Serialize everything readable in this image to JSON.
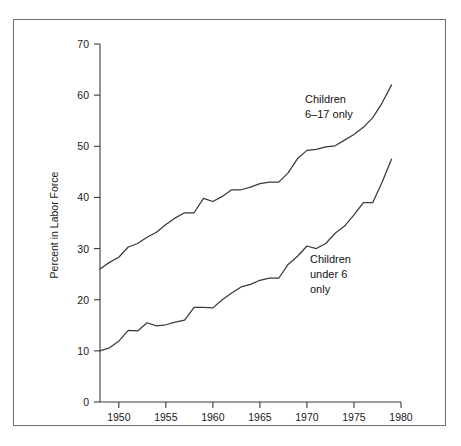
{
  "chart_data": {
    "type": "line",
    "title": "",
    "xlabel": "",
    "ylabel": "Percent in Labor Force",
    "xlim": [
      1948,
      1980
    ],
    "ylim": [
      0,
      70
    ],
    "xticks": [
      1950,
      1955,
      1960,
      1965,
      1970,
      1975,
      1980
    ],
    "yticks": [
      0,
      10,
      20,
      30,
      40,
      50,
      60,
      70
    ],
    "grid": false,
    "legend_position": "inline-annotation",
    "x": [
      1948,
      1949,
      1950,
      1951,
      1952,
      1953,
      1954,
      1955,
      1956,
      1957,
      1958,
      1959,
      1960,
      1961,
      1962,
      1963,
      1964,
      1965,
      1966,
      1967,
      1968,
      1969,
      1970,
      1971,
      1972,
      1973,
      1974,
      1975,
      1976,
      1977,
      1978,
      1979
    ],
    "series": [
      {
        "name": "Children 6-17 only",
        "annotation": "Children\n6–17 only",
        "values": [
          26.0,
          27.3,
          28.3,
          30.3,
          31.0,
          32.2,
          33.2,
          34.7,
          36.0,
          37.0,
          37.0,
          39.8,
          39.2,
          40.2,
          41.5,
          41.5,
          42.0,
          42.7,
          43.0,
          43.0,
          44.8,
          47.6,
          49.2,
          49.4,
          49.9,
          50.1,
          51.2,
          52.3,
          53.7,
          55.6,
          58.5,
          62.0
        ]
      },
      {
        "name": "Children under 6 only",
        "annotation": "Children\nunder 6\nonly",
        "values": [
          10.0,
          10.6,
          11.9,
          14.0,
          13.9,
          15.5,
          14.9,
          15.1,
          15.6,
          16.0,
          18.5,
          18.5,
          18.4,
          20.0,
          21.3,
          22.5,
          23.0,
          23.8,
          24.2,
          24.2,
          26.9,
          28.5,
          30.5,
          30.0,
          31.0,
          33.0,
          34.4,
          36.6,
          39.0,
          39.0,
          43.0,
          47.5
        ]
      }
    ],
    "annotations": [
      {
        "id": "upper-series-label",
        "lines": [
          "Children",
          "6–17 only"
        ]
      },
      {
        "id": "lower-series-label",
        "lines": [
          "Children",
          "under 6",
          "only"
        ]
      }
    ],
    "colors": {
      "line": "#3a3a3a",
      "axis": "#3c3c3c",
      "frame": "#6e6e6e",
      "text": "#1a1a1a",
      "background": "#ffffff"
    }
  }
}
